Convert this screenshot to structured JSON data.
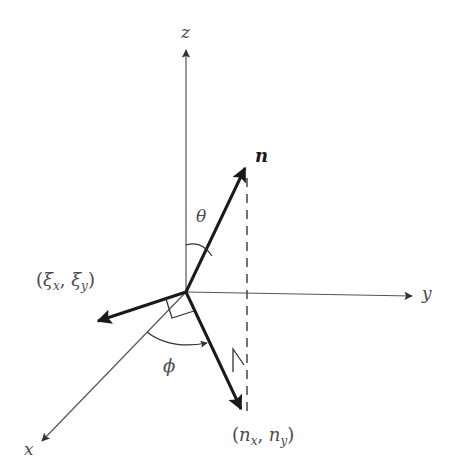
{
  "diagram": {
    "title": "",
    "labels": {
      "z_axis": "z",
      "y_axis": "y",
      "x_axis": "x",
      "n_vector": "n",
      "theta": "θ",
      "phi": "ϕ",
      "xi_vector": "(ξx, ξy)",
      "xi_open": "(",
      "xi_sym1": "ξ",
      "xi_sub1": "x",
      "xi_sep": ", ",
      "xi_sym2": "ξ",
      "xi_sub2": "y",
      "xi_close": ")",
      "n_proj": "(nx, ny)",
      "np_open": "(",
      "np_sym1": "n",
      "np_sub1": "x",
      "np_sep": ", ",
      "np_sym2": "n",
      "np_sub2": "y",
      "np_close": ")"
    },
    "colors": {
      "axis": "#555555",
      "vector": "#222222",
      "label": "#4a4a4a",
      "background": "#ffffff"
    },
    "geometry": {
      "origin": [
        186,
        292
      ],
      "z_axis_end": [
        186,
        48
      ],
      "y_axis_end": [
        414,
        296
      ],
      "x_axis_end": [
        40,
        443
      ],
      "n_tip": [
        246,
        165
      ],
      "xi_tip": [
        96,
        322
      ],
      "n_proj_tip": [
        242,
        412
      ]
    }
  }
}
